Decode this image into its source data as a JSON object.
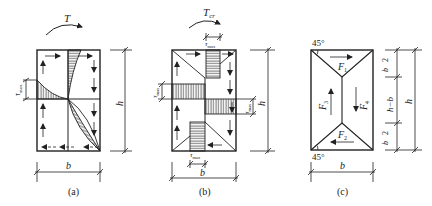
{
  "figure": {
    "panels": [
      {
        "id": "a",
        "caption": "(a)",
        "torque_label": "T",
        "stress_label": "τmax",
        "width_label": "b",
        "height_label": "h"
      },
      {
        "id": "b",
        "caption": "(b)",
        "torque_label": "Tcr",
        "torque_main": "T",
        "torque_sub": "cr",
        "stress_label_top": "τmax",
        "stress_label_left": "τmax",
        "stress_label_right": "τmax",
        "stress_label_bottom": "τmax",
        "tau": "τ",
        "tau_sub": "max",
        "width_label": "b",
        "height_label": "h"
      },
      {
        "id": "c",
        "caption": "(c)",
        "angle_top": "45°",
        "angle_bottom": "45°",
        "forces": [
          "F1",
          "F2",
          "F3",
          "F4"
        ],
        "force_main": "F",
        "force_subs": [
          "1",
          "2",
          "3",
          "4"
        ],
        "width_label": "b",
        "height_label": "h",
        "segment_top": "b/2",
        "segment_mid": "h−b",
        "segment_bottom": "b/2",
        "frac_num": "b",
        "frac_den": "2"
      }
    ]
  },
  "colors": {
    "line": "#222222",
    "background": "#ffffff"
  }
}
